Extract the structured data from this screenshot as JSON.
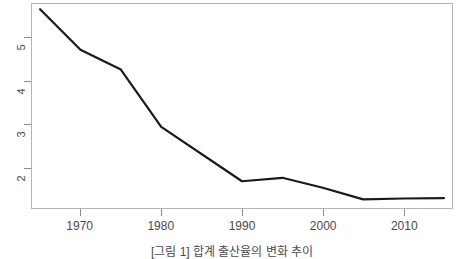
{
  "chart_data": {
    "type": "line",
    "title": "",
    "subtitle": "",
    "xlabel": "",
    "ylabel": "",
    "xlim": [
      1964,
      2016
    ],
    "ylim": [
      1.05,
      5.78
    ],
    "xticks": [
      1970,
      1980,
      1990,
      2000,
      2010
    ],
    "xticklabels": [
      "1970",
      "1980",
      "1990",
      "2000",
      "2010"
    ],
    "yticks": [
      2,
      3,
      4,
      5
    ],
    "yticklabels": [
      "2",
      "3",
      "4",
      "5"
    ],
    "grid": false,
    "legend": false,
    "legend_position": "none",
    "line_color": "#1a1a1a",
    "line_width": 2.2,
    "frame_color": "#b4b4b4",
    "axis_color": "#8c8c8c",
    "series": [
      {
        "name": "series-1",
        "x": [
          1965,
          1970,
          1975,
          1980,
          1990,
          1995,
          2000,
          2005,
          2010,
          2015
        ],
        "values": [
          5.66,
          4.72,
          4.26,
          2.93,
          1.67,
          1.75,
          1.52,
          1.25,
          1.27,
          1.28
        ]
      }
    ]
  },
  "caption": {
    "text": "[그림 1] 합계 출산율의 변화 추이"
  },
  "axes": {
    "x_axis_name": "year-axis",
    "y_axis_name": "value-axis"
  }
}
